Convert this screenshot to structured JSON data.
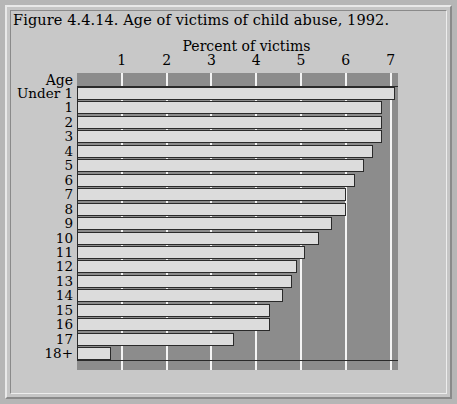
{
  "figure": {
    "title": "Figure 4.4.14. Age of victims of child abuse, 1992.",
    "axis_title": "Percent of victims",
    "age_header": "Age"
  },
  "colors": {
    "page_background": "#b6b6b6",
    "panel_background": "#c8c8c8",
    "plot_background": "#8c8c8c",
    "bar_fill": "#dcdcdc",
    "bar_outline": "#2a2a2a",
    "gridline": "#f4f4f4"
  },
  "chart_data": {
    "type": "bar",
    "orientation": "horizontal",
    "title": "Figure 4.4.14. Age of victims of child abuse, 1992.",
    "xlabel": "Percent of victims",
    "ylabel": "Age",
    "xlim": [
      0,
      7.17
    ],
    "xticks": [
      1,
      2,
      3,
      4,
      5,
      6,
      7
    ],
    "xtick_labels": [
      "1",
      "2",
      "3",
      "4",
      "5",
      "6",
      "7"
    ],
    "grid": true,
    "legend": null,
    "categories": [
      "Under 1",
      "1",
      "2",
      "3",
      "4",
      "5",
      "6",
      "7",
      "8",
      "9",
      "10",
      "11",
      "12",
      "13",
      "14",
      "15",
      "16",
      "17",
      "18+"
    ],
    "values": [
      7.1,
      6.8,
      6.8,
      6.8,
      6.6,
      6.4,
      6.2,
      6.0,
      6.0,
      5.7,
      5.4,
      5.1,
      4.9,
      4.8,
      4.6,
      4.3,
      4.3,
      3.5,
      0.75
    ]
  }
}
